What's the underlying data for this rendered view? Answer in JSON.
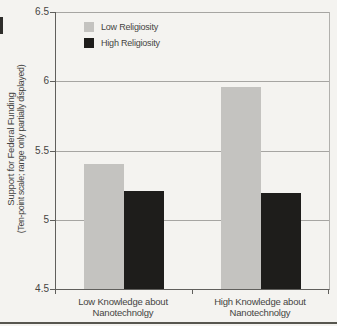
{
  "colors": {
    "background": "#f4f3f0",
    "grid": "#a6a5a2",
    "axis": "#605f5c",
    "right_border": "#b1b0ad",
    "text": "#454442",
    "bottom_rule": "#57564f",
    "artifact": "#2e2d2b",
    "low_religiosity_bar": "#c4c3c0",
    "high_religiosity_bar": "#1e1d1b"
  },
  "chart_data": {
    "type": "bar",
    "title": "",
    "ylabel_line1": "Support for Federal Funding",
    "ylabel_line2": "(Ten-point scale; range only partially displayed)",
    "ylim": [
      4.5,
      6.5
    ],
    "yticks": [
      6.5,
      6,
      5.5,
      5,
      4.5
    ],
    "ytick_labels": [
      "6.5",
      "6",
      "5.5",
      "5",
      "4.5"
    ],
    "grid": true,
    "legend_position": "top-left",
    "categories": [
      [
        "Low Knowledge about",
        "Nanotechnolgy"
      ],
      [
        "High Knowledge about",
        "Nanotechnolgy"
      ]
    ],
    "series": [
      {
        "name": "Low Religiosity",
        "color": "#c4c3c0",
        "values": [
          5.4,
          5.96
        ]
      },
      {
        "name": "High Religiosity",
        "color": "#1e1d1b",
        "values": [
          5.21,
          5.19
        ]
      }
    ]
  }
}
